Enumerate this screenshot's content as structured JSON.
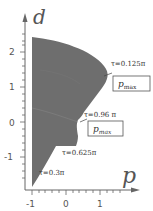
{
  "figure": {
    "x_axis": {
      "label": "p",
      "ticks": [
        "-1",
        "0",
        "1"
      ]
    },
    "y_axis": {
      "label": "d",
      "ticks": [
        "2",
        "1",
        "0",
        "-1"
      ]
    },
    "region_color": "#6e6e6e",
    "annotations": {
      "tau1": "τ=0.125π",
      "tau2": "τ=0.96 π",
      "tau3": "τ=0.625π",
      "tau4": "τ=0.3π",
      "pmax1_main": "p",
      "pmax1_sub": "max",
      "pmax2_main": "p",
      "pmax2_sub": "max"
    }
  }
}
